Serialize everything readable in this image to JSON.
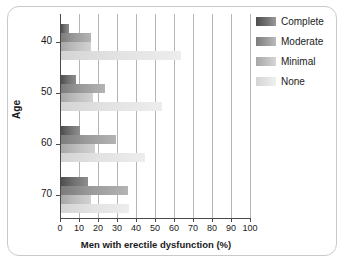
{
  "chart_data": {
    "type": "bar",
    "orientation": "horizontal",
    "title": "",
    "xlabel": "Men with erectile dysfunction (%)",
    "ylabel": "Age",
    "categories": [
      "40",
      "50",
      "60",
      "70"
    ],
    "xlim": [
      0,
      100
    ],
    "xticks": [
      0,
      10,
      20,
      30,
      40,
      50,
      60,
      70,
      80,
      90,
      100
    ],
    "xtick_labels": [
      "0",
      "10",
      "20",
      "30",
      "40",
      "50",
      "60",
      "70",
      "80",
      "90",
      "100"
    ],
    "grid": "vertical",
    "legend_position": "top-right",
    "series": [
      {
        "name": "Complete",
        "color": "#5a5a5a",
        "values": [
          4,
          8,
          10,
          14
        ]
      },
      {
        "name": "Moderate",
        "color": "#8b8b8b",
        "values": [
          16,
          23,
          29,
          35
        ]
      },
      {
        "name": "Minimal",
        "color": "#b5b5b5",
        "values": [
          16,
          17,
          18,
          16
        ]
      },
      {
        "name": "None",
        "color": "#e0e0e0",
        "values": [
          63,
          53,
          44,
          36
        ]
      }
    ]
  },
  "legend": {
    "items": [
      {
        "label": "Complete"
      },
      {
        "label": "Moderate"
      },
      {
        "label": "Minimal"
      },
      {
        "label": "None"
      }
    ]
  },
  "axes": {
    "x_title": "Men with erectile dysfunction (%)",
    "y_title": "Age"
  }
}
